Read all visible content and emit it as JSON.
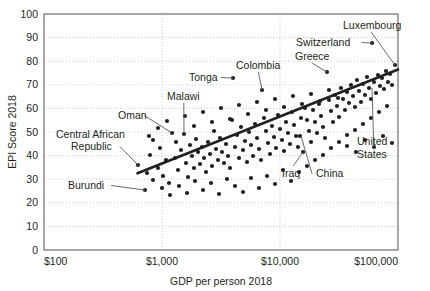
{
  "chart_data": {
    "type": "scatter",
    "title": "",
    "xlabel": "GDP per person 2018",
    "ylabel": "EPI Score 2018",
    "xscale": "log",
    "xlim": [
      100,
      100000
    ],
    "ylim": [
      0,
      100
    ],
    "grid": true,
    "legend": "none",
    "x_tick_labels": [
      "$100",
      "$1,000",
      "$10,000",
      "$100,000"
    ],
    "x_ticks": [
      100,
      1000,
      10000,
      100000
    ],
    "y_tick_labels": [
      "0",
      "10",
      "20",
      "30",
      "40",
      "50",
      "60",
      "70",
      "80",
      "90",
      "100"
    ],
    "y_ticks": [
      0,
      10,
      20,
      30,
      40,
      50,
      60,
      70,
      80,
      90,
      100
    ],
    "trendline": {
      "x0": 620,
      "y0": 32.5,
      "x1": 100000,
      "y1": 76.5
    },
    "annotations": [
      {
        "label": "Luxembourg",
        "lx": 343,
        "ly": 29,
        "px": 395,
        "py": 65,
        "leader": "line"
      },
      {
        "label": "Switzerland",
        "lx": 296,
        "ly": 46,
        "px": 372,
        "py": 43,
        "leader": "arrow"
      },
      {
        "label": "Greece",
        "lx": 295,
        "ly": 60,
        "px": 327,
        "py": 72,
        "leader": "line"
      },
      {
        "label": "Colombia",
        "lx": 236,
        "ly": 69,
        "px": 262,
        "py": 90,
        "leader": "line"
      },
      {
        "label": "Tonga",
        "lx": 189,
        "ly": 81,
        "px": 233,
        "py": 78,
        "leader": "arrow"
      },
      {
        "label": "Malawi",
        "lx": 167,
        "ly": 100,
        "px": 184,
        "py": 134,
        "leader": "line"
      },
      {
        "label": "Oman",
        "lx": 118,
        "ly": 119,
        "px": 172,
        "py": 133,
        "leader": "arrow"
      },
      {
        "label": "Central African",
        "lx": 56,
        "ly": 138,
        "px": null,
        "py": null,
        "leader": "none"
      },
      {
        "label": "Republic",
        "lx": 71,
        "ly": 150,
        "px": 138,
        "py": 165,
        "leader": "arrow"
      },
      {
        "label": "Burundi",
        "lx": 68,
        "ly": 189,
        "px": 145,
        "py": 190,
        "leader": "arrow"
      },
      {
        "label": "Iraq",
        "lx": 282,
        "ly": 177,
        "px": 303,
        "py": 152,
        "leader": "line"
      },
      {
        "label": "China",
        "lx": 316,
        "ly": 177,
        "px": 301,
        "py": 136,
        "leader": "line"
      },
      {
        "label": "United",
        "lx": 357,
        "ly": 145,
        "px": null,
        "py": null,
        "leader": "none"
      },
      {
        "label": "States",
        "lx": 357,
        "ly": 158,
        "px": 372,
        "py": 88,
        "leader": "line"
      }
    ],
    "points_px": [
      [
        138,
        165
      ],
      [
        145,
        190
      ],
      [
        147,
        173
      ],
      [
        150,
        155
      ],
      [
        153,
        180
      ],
      [
        158,
        168
      ],
      [
        160,
        148
      ],
      [
        163,
        176
      ],
      [
        166,
        160
      ],
      [
        169,
        183
      ],
      [
        172,
        133
      ],
      [
        175,
        158
      ],
      [
        178,
        170
      ],
      [
        181,
        150
      ],
      [
        184,
        134
      ],
      [
        186,
        163
      ],
      [
        188,
        177
      ],
      [
        190,
        145
      ],
      [
        192,
        156
      ],
      [
        194,
        168
      ],
      [
        196,
        139
      ],
      [
        198,
        152
      ],
      [
        200,
        164
      ],
      [
        202,
        147
      ],
      [
        204,
        158
      ],
      [
        206,
        172
      ],
      [
        208,
        142
      ],
      [
        210,
        154
      ],
      [
        212,
        166
      ],
      [
        214,
        131
      ],
      [
        216,
        149
      ],
      [
        218,
        160
      ],
      [
        220,
        138
      ],
      [
        222,
        152
      ],
      [
        224,
        163
      ],
      [
        226,
        144
      ],
      [
        228,
        156
      ],
      [
        230,
        168
      ],
      [
        232,
        120
      ],
      [
        233,
        78
      ],
      [
        235,
        147
      ],
      [
        237,
        135
      ],
      [
        239,
        158
      ],
      [
        241,
        127
      ],
      [
        243,
        150
      ],
      [
        245,
        141
      ],
      [
        247,
        162
      ],
      [
        249,
        132
      ],
      [
        251,
        145
      ],
      [
        253,
        156
      ],
      [
        255,
        124
      ],
      [
        257,
        138
      ],
      [
        259,
        149
      ],
      [
        261,
        160
      ],
      [
        262,
        90
      ],
      [
        264,
        118
      ],
      [
        266,
        131
      ],
      [
        268,
        143
      ],
      [
        270,
        154
      ],
      [
        272,
        126
      ],
      [
        274,
        137
      ],
      [
        276,
        148
      ],
      [
        278,
        115
      ],
      [
        280,
        129
      ],
      [
        282,
        140
      ],
      [
        284,
        151
      ],
      [
        286,
        122
      ],
      [
        288,
        133
      ],
      [
        290,
        144
      ],
      [
        292,
        112
      ],
      [
        294,
        125
      ],
      [
        296,
        136
      ],
      [
        298,
        147
      ],
      [
        300,
        136
      ],
      [
        301,
        118
      ],
      [
        303,
        152
      ],
      [
        305,
        108
      ],
      [
        307,
        120
      ],
      [
        309,
        131
      ],
      [
        311,
        142
      ],
      [
        313,
        110
      ],
      [
        315,
        122
      ],
      [
        317,
        133
      ],
      [
        319,
        104
      ],
      [
        321,
        116
      ],
      [
        323,
        127
      ],
      [
        325,
        138
      ],
      [
        327,
        72
      ],
      [
        329,
        100
      ],
      [
        331,
        111
      ],
      [
        333,
        122
      ],
      [
        335,
        95
      ],
      [
        337,
        106
      ],
      [
        339,
        117
      ],
      [
        341,
        88
      ],
      [
        343,
        99
      ],
      [
        345,
        110
      ],
      [
        347,
        92
      ],
      [
        349,
        103
      ],
      [
        351,
        85
      ],
      [
        353,
        96
      ],
      [
        355,
        107
      ],
      [
        357,
        80
      ],
      [
        359,
        91
      ],
      [
        361,
        102
      ],
      [
        363,
        84
      ],
      [
        365,
        95
      ],
      [
        367,
        77
      ],
      [
        369,
        88
      ],
      [
        371,
        99
      ],
      [
        372,
        43
      ],
      [
        374,
        82
      ],
      [
        376,
        93
      ],
      [
        378,
        75
      ],
      [
        380,
        86
      ],
      [
        382,
        78
      ],
      [
        384,
        89
      ],
      [
        386,
        71
      ],
      [
        388,
        82
      ],
      [
        390,
        74
      ],
      [
        392,
        85
      ],
      [
        395,
        65
      ],
      [
        153,
        140
      ],
      [
        162,
        188
      ],
      [
        170,
        195
      ],
      [
        179,
        186
      ],
      [
        187,
        193
      ],
      [
        195,
        181
      ],
      [
        203,
        190
      ],
      [
        211,
        183
      ],
      [
        219,
        194
      ],
      [
        227,
        179
      ],
      [
        235,
        186
      ],
      [
        243,
        192
      ],
      [
        251,
        178
      ],
      [
        259,
        188
      ],
      [
        267,
        176
      ],
      [
        275,
        184
      ],
      [
        283,
        170
      ],
      [
        291,
        181
      ],
      [
        299,
        172
      ],
      [
        307,
        166
      ],
      [
        315,
        160
      ],
      [
        323,
        155
      ],
      [
        331,
        148
      ],
      [
        339,
        142
      ],
      [
        347,
        135
      ],
      [
        355,
        130
      ],
      [
        363,
        124
      ],
      [
        371,
        118
      ],
      [
        379,
        112
      ],
      [
        387,
        106
      ],
      [
        149,
        136
      ],
      [
        158,
        128
      ],
      [
        167,
        121
      ],
      [
        176,
        142
      ],
      [
        185,
        116
      ],
      [
        194,
        126
      ],
      [
        203,
        112
      ],
      [
        212,
        122
      ],
      [
        221,
        108
      ],
      [
        230,
        119
      ],
      [
        239,
        105
      ],
      [
        248,
        114
      ],
      [
        257,
        102
      ],
      [
        266,
        110
      ],
      [
        275,
        99
      ],
      [
        284,
        107
      ],
      [
        293,
        96
      ],
      [
        302,
        104
      ],
      [
        311,
        94
      ],
      [
        320,
        101
      ],
      [
        329,
        90
      ],
      [
        338,
        98
      ],
      [
        347,
        146
      ],
      [
        356,
        152
      ],
      [
        365,
        140
      ],
      [
        374,
        147
      ],
      [
        383,
        136
      ],
      [
        392,
        143
      ]
    ]
  }
}
